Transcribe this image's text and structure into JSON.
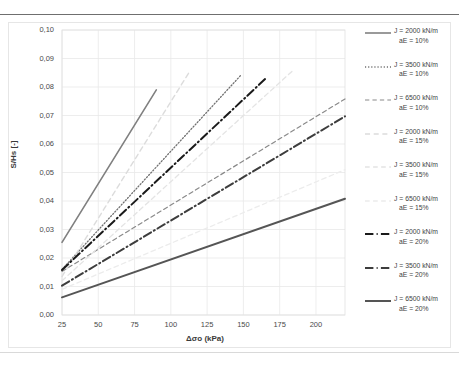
{
  "chart_data": {
    "type": "line",
    "title": "",
    "xlabel": "Δσo (kPa)",
    "ylabel": "S/Hs [-]",
    "xlim": [
      25,
      220
    ],
    "ylim": [
      0.0,
      0.1
    ],
    "xticks": [
      25,
      50,
      75,
      100,
      125,
      150,
      175,
      200
    ],
    "xtick_labels": [
      "25",
      "50",
      "75",
      "100",
      "125",
      "150",
      "175",
      "200"
    ],
    "yticks": [
      0.0,
      0.01,
      0.02,
      0.03,
      0.04,
      0.05,
      0.06,
      0.07,
      0.08,
      0.09,
      0.1
    ],
    "ytick_labels": [
      "0,00",
      "0,01",
      "0,02",
      "0,03",
      "0,04",
      "0,05",
      "0,06",
      "0,07",
      "0,08",
      "0,09",
      "0,10"
    ],
    "grid": true,
    "legend_position": "right",
    "series": [
      {
        "name": "J = 2000 kN/m aE = 10%",
        "label_line1": "J = 2000 kN/m",
        "label_line2": "aE = 10%",
        "J": 2000,
        "aE": "10%",
        "style": "solid",
        "color": "#808080",
        "width": 1.6,
        "x": [
          25,
          90
        ],
        "y": [
          0.0255,
          0.079
        ]
      },
      {
        "name": "J = 3500 kN/m aE = 10%",
        "label_line1": "J = 3500 kN/m",
        "label_line2": "aE = 10%",
        "J": 3500,
        "aE": "10%",
        "style": "dotted",
        "color": "#707070",
        "width": 1.3,
        "x": [
          25,
          148
        ],
        "y": [
          0.016,
          0.084
        ]
      },
      {
        "name": "J = 6500 kN/m aE = 10%",
        "label_line1": "J = 6500 kN/m",
        "label_line2": "aE = 10%",
        "J": 6500,
        "aE": "10%",
        "style": "dashed",
        "color": "#8a8a8a",
        "width": 1.2,
        "x": [
          25,
          220
        ],
        "y": [
          0.0153,
          0.0758
        ]
      },
      {
        "name": "J = 2000 kN/m aE = 15%",
        "label_line1": "J = 2000 kN/m",
        "label_line2": "aE = 15%",
        "J": 2000,
        "aE": "15%",
        "style": "dashed",
        "color": "#dcdcdc",
        "width": 1.4,
        "x": [
          25,
          113
        ],
        "y": [
          0.0135,
          0.0855
        ]
      },
      {
        "name": "J = 3500 kN/m aE = 15%",
        "label_line1": "J = 3500 kN/m",
        "label_line2": "aE = 15%",
        "J": 3500,
        "aE": "15%",
        "style": "dashed",
        "color": "#e4e4e4",
        "width": 1.3,
        "x": [
          25,
          185
        ],
        "y": [
          0.012,
          0.0862
        ]
      },
      {
        "name": "J = 6500 kN/m aE = 15%",
        "label_line1": "J = 6500 kN/m",
        "label_line2": "aE = 15%",
        "J": 6500,
        "aE": "15%",
        "style": "dashed",
        "color": "#ececec",
        "width": 1.3,
        "x": [
          25,
          220
        ],
        "y": [
          0.009,
          0.051
        ]
      },
      {
        "name": "J = 2000 kN/m aE = 20%",
        "label_line1": "J = 2000 kN/m",
        "label_line2": "aE = 20%",
        "J": 2000,
        "aE": "20%",
        "style": "dashdot",
        "color": "#1a1a1a",
        "width": 2.0,
        "x": [
          25,
          166
        ],
        "y": [
          0.0158,
          0.0833
        ]
      },
      {
        "name": "J = 3500 kN/m aE = 20%",
        "label_line1": "J = 3500 kN/m",
        "label_line2": "aE = 20%",
        "J": 3500,
        "aE": "20%",
        "style": "dashdot",
        "color": "#3d3d3d",
        "width": 2.0,
        "x": [
          25,
          220
        ],
        "y": [
          0.0103,
          0.0697
        ]
      },
      {
        "name": "J = 6500 kN/m aE = 20%",
        "label_line1": "J = 6500 kN/m",
        "label_line2": "aE = 20%",
        "J": 6500,
        "aE": "20%",
        "style": "solid",
        "color": "#555555",
        "width": 2.0,
        "x": [
          25,
          220
        ],
        "y": [
          0.0062,
          0.0408
        ]
      }
    ]
  },
  "axes": {
    "y_title": "S/Hs [-]",
    "x_title": "Δσo (kPa)"
  }
}
